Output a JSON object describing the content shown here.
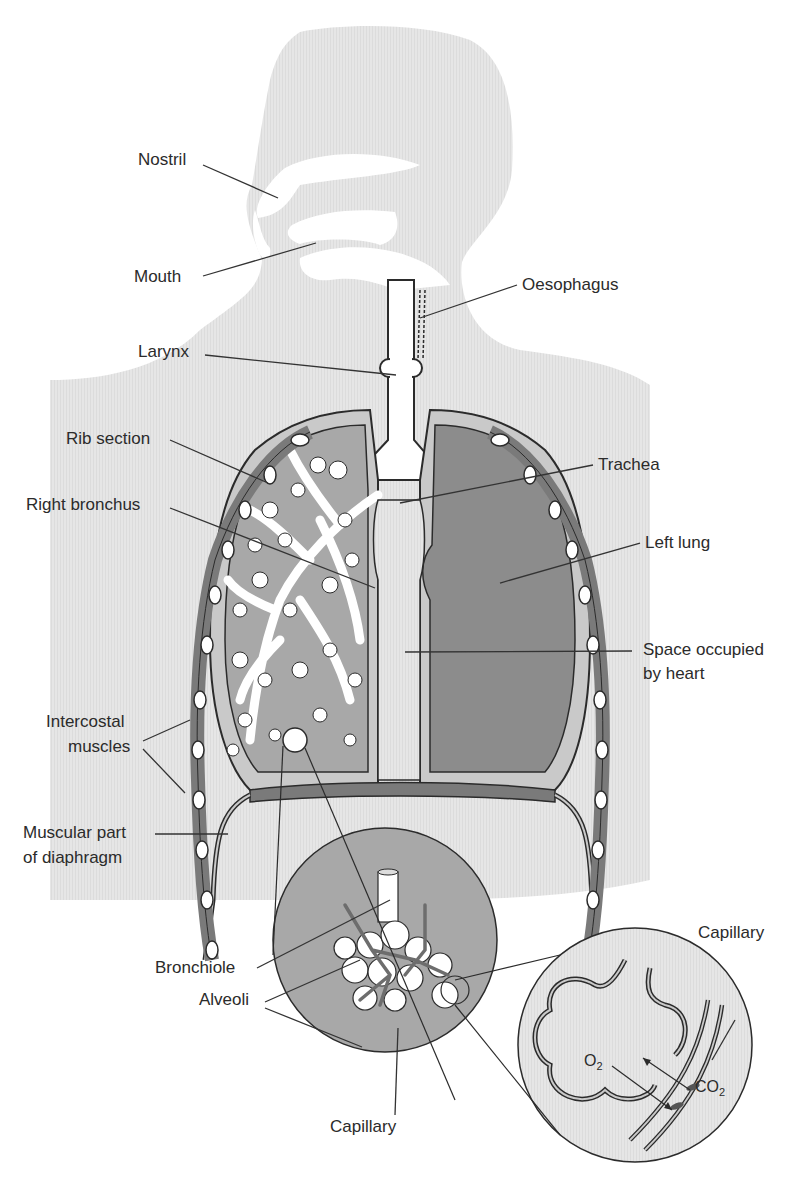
{
  "figure": {
    "colors": {
      "body_silhouette": "#e4e4e4",
      "lung_tissue": "#a8a8a8",
      "lung_dark": "#8c8c8c",
      "pleura_light": "#c9c9c9",
      "airway_white": "#ffffff",
      "muscle": "#7a7a7a",
      "outline": "#2b2b2b",
      "label_text": "#2b2b2b",
      "leader_line": "#333333"
    }
  },
  "labels": {
    "nostril": "Nostril",
    "mouth": "Mouth",
    "oesophagus": "Oesophagus",
    "larynx": "Larynx",
    "rib_section": "Rib section",
    "trachea": "Trachea",
    "right_bronchus": "Right bronchus",
    "left_lung": "Left lung",
    "space_heart_line1": "Space occupied",
    "space_heart_line2": "by heart",
    "intercostal_line1": "Intercostal",
    "intercostal_line2": "muscles",
    "diaphragm_line1": "Muscular part",
    "diaphragm_line2": "of diaphragm",
    "bronchiole": "Bronchiole",
    "alveoli": "Alveoli",
    "capillary_bottom": "Capillary",
    "capillary_inset": "Capillary"
  },
  "gas_exchange": {
    "oxygen": {
      "symbol": "O",
      "subscript": "2"
    },
    "carbon_dioxide": {
      "symbol": "CO",
      "subscript": "2"
    }
  }
}
